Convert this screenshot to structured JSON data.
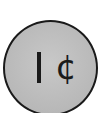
{
  "coin": {
    "value_symbol": "¢",
    "value_digit": "1",
    "label": "1¢",
    "colors": {
      "face": "#b8b8b8",
      "outline": "#1a1a1a",
      "text": "#1a1a1a"
    }
  }
}
